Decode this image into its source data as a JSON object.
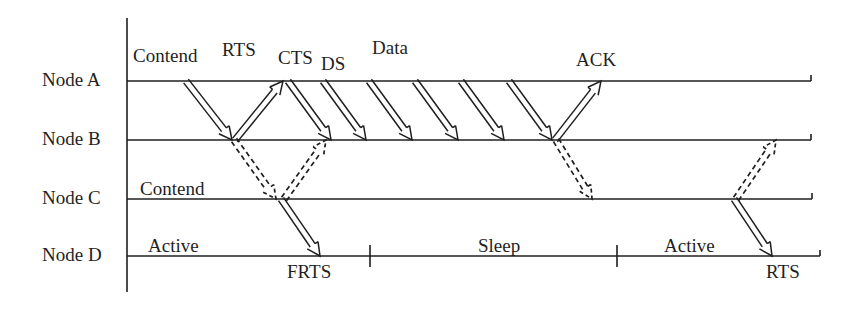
{
  "diagram": {
    "colors": {
      "line": "#1f1f1f",
      "text": "#1f1f1f",
      "background": "#ffffff"
    },
    "axis": {
      "x": 127,
      "top": 18,
      "bottom": 292
    },
    "timelines": [
      {
        "id": "A",
        "label": "Node A",
        "y": 81,
        "label_x": 42,
        "label_y": 70,
        "x_start": 127,
        "x_end": 811
      },
      {
        "id": "B",
        "label": "Node B",
        "y": 140,
        "label_x": 42,
        "label_y": 129,
        "x_start": 127,
        "x_end": 811
      },
      {
        "id": "C",
        "label": "Node C",
        "y": 199,
        "label_x": 42,
        "label_y": 188,
        "x_start": 127,
        "x_end": 812
      },
      {
        "id": "D",
        "label": "Node D",
        "y": 256,
        "label_x": 42,
        "label_y": 245,
        "x_start": 127,
        "x_end": 820
      }
    ],
    "message_labels": [
      {
        "text": "Contend",
        "x": 133,
        "y": 46,
        "name": "label-contend-a"
      },
      {
        "text": "RTS",
        "x": 222,
        "y": 40,
        "name": "label-rts"
      },
      {
        "text": "CTS",
        "x": 278,
        "y": 48,
        "name": "label-cts"
      },
      {
        "text": "DS",
        "x": 321,
        "y": 54,
        "name": "label-ds"
      },
      {
        "text": "Data",
        "x": 372,
        "y": 38,
        "name": "label-data"
      },
      {
        "text": "ACK",
        "x": 576,
        "y": 50,
        "name": "label-ack"
      },
      {
        "text": "Contend",
        "x": 140,
        "y": 179,
        "name": "label-contend-c"
      },
      {
        "text": "Active",
        "x": 148,
        "y": 236,
        "name": "label-active-1"
      },
      {
        "text": "Sleep",
        "x": 478,
        "y": 236,
        "name": "label-sleep"
      },
      {
        "text": "Active",
        "x": 664,
        "y": 236,
        "name": "label-active-2"
      },
      {
        "text": "FRTS",
        "x": 287,
        "y": 262,
        "name": "label-frts"
      },
      {
        "text": "RTS",
        "x": 766,
        "y": 262,
        "name": "label-rts-bottom"
      }
    ],
    "solid_arrows": [
      {
        "name": "arrow-rts-a-to-b",
        "from": "A",
        "to": "B",
        "x1": 186,
        "x2": 232
      },
      {
        "name": "arrow-cts-b-to-a",
        "from": "B",
        "to": "A",
        "x1": 235,
        "x2": 283
      },
      {
        "name": "arrow-ds-a-to-b",
        "from": "A",
        "to": "B",
        "x1": 288,
        "x2": 331
      },
      {
        "name": "arrow-data-1-a-to-b",
        "from": "A",
        "to": "B",
        "x1": 323,
        "x2": 366
      },
      {
        "name": "arrow-data-2-a-to-b",
        "from": "A",
        "to": "B",
        "x1": 369,
        "x2": 412
      },
      {
        "name": "arrow-data-3-a-to-b",
        "from": "A",
        "to": "B",
        "x1": 415,
        "x2": 458
      },
      {
        "name": "arrow-data-4-a-to-b",
        "from": "A",
        "to": "B",
        "x1": 461,
        "x2": 504
      },
      {
        "name": "arrow-data-5-a-to-b",
        "from": "A",
        "to": "B",
        "x1": 509,
        "x2": 552
      },
      {
        "name": "arrow-ack-b-to-a",
        "from": "B",
        "to": "A",
        "x1": 555,
        "x2": 601
      },
      {
        "name": "arrow-frts-c-to-d",
        "from": "C",
        "to": "D",
        "x1": 281,
        "x2": 320
      },
      {
        "name": "arrow-rts-c-to-d",
        "from": "C",
        "to": "D",
        "x1": 734,
        "x2": 772
      }
    ],
    "dashed_arrows": [
      {
        "name": "dashed-b-to-c-rts",
        "from": "B",
        "to": "C",
        "x1": 234,
        "x2": 276
      },
      {
        "name": "dashed-c-to-b-cts",
        "from": "C",
        "to": "B",
        "x1": 284,
        "x2": 326
      },
      {
        "name": "dashed-b-to-c-ack",
        "from": "B",
        "to": "C",
        "x1": 556,
        "x2": 592
      },
      {
        "name": "dashed-c-to-b-rts",
        "from": "C",
        "to": "B",
        "x1": 736,
        "x2": 776
      }
    ],
    "d_ticks": [
      {
        "name": "tick-sleep-start",
        "x": 370
      },
      {
        "name": "tick-sleep-end",
        "x": 617
      }
    ]
  }
}
